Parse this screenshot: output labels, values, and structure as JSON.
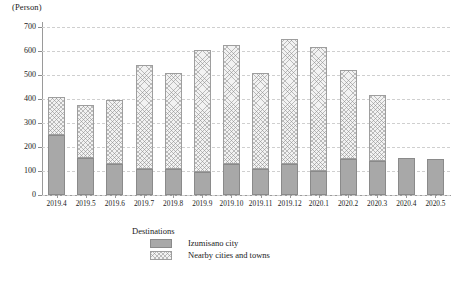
{
  "chart_data": {
    "type": "bar",
    "stacked": true,
    "title": "",
    "subtitle": "",
    "unit_label": "(Person)",
    "xlabel": "",
    "ylabel": "",
    "ylim": [
      0,
      700
    ],
    "ytick_labels": [
      "0",
      "100",
      "200",
      "300",
      "400",
      "500",
      "600",
      "700"
    ],
    "ytick_values": [
      0,
      100,
      200,
      300,
      400,
      500,
      600,
      700
    ],
    "grid": true,
    "grid_axis": "y",
    "legend_position": "bottom-center",
    "legend_title": "Destinations",
    "categories": [
      "2019.4",
      "2019.5",
      "2019.6",
      "2019.7",
      "2019.8",
      "2019.9",
      "2019.10",
      "2019.11",
      "2019.12",
      "2020.1",
      "2020.2",
      "2020.3",
      "2020.4",
      "2020.5"
    ],
    "series": [
      {
        "name": "Izumisano city",
        "color": "#a8a8a8",
        "pattern": "solid",
        "values": [
          250,
          155,
          130,
          110,
          110,
          95,
          130,
          110,
          130,
          100,
          150,
          140,
          155,
          150
        ]
      },
      {
        "name": "Nearby cities and towns",
        "color": "#f2f2f2",
        "pattern": "cross-hatch",
        "values": [
          160,
          220,
          265,
          430,
          400,
          510,
          495,
          400,
          520,
          515,
          370,
          275,
          0,
          0
        ]
      }
    ],
    "totals": [
      410,
      375,
      395,
      540,
      510,
      605,
      625,
      510,
      650,
      615,
      520,
      415,
      155,
      150
    ]
  },
  "legend": {
    "title": "Destinations",
    "entries": [
      {
        "label": "Izumisano city"
      },
      {
        "label": "Nearby cities and towns"
      }
    ]
  }
}
